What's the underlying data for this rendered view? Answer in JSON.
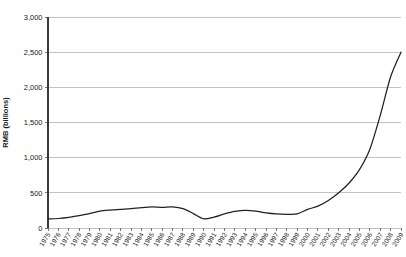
{
  "chart_data": {
    "type": "line",
    "title": "",
    "subtitle": "",
    "xlabel": "",
    "ylabel": "RMB (billions)",
    "ylim": [
      0,
      3000
    ],
    "ytick_step": 500,
    "ytick_labels": [
      "0",
      "500",
      "1,000",
      "1,500",
      "2,000",
      "2,500",
      "3,000"
    ],
    "ytick_values": [
      0,
      500,
      1000,
      1500,
      2000,
      2500,
      3000
    ],
    "grid": "horizontal",
    "legend": "none",
    "series_color": "#212121",
    "gridline_color": "#bdbdbd",
    "axis_color": "#3a3a3a",
    "categories": [
      "1975",
      "1976",
      "1977",
      "1978",
      "1979",
      "1980",
      "1981",
      "1982",
      "1983",
      "1984",
      "1985",
      "1986",
      "1987",
      "1988",
      "1989",
      "1990",
      "1991",
      "1992",
      "1993",
      "1994",
      "1995",
      "1996",
      "1997",
      "1998",
      "1999",
      "2000",
      "2001",
      "2002",
      "2003",
      "2004",
      "2005",
      "2006",
      "2007",
      "2008",
      "2009"
    ],
    "series": [
      {
        "name": "RMB (billions)",
        "values": [
          130,
          135,
          150,
          175,
          205,
          240,
          255,
          265,
          275,
          290,
          300,
          295,
          300,
          275,
          205,
          130,
          155,
          200,
          235,
          250,
          240,
          215,
          200,
          195,
          200,
          265,
          310,
          390,
          500,
          640,
          830,
          1120,
          1600,
          2150,
          2500
        ]
      }
    ]
  }
}
